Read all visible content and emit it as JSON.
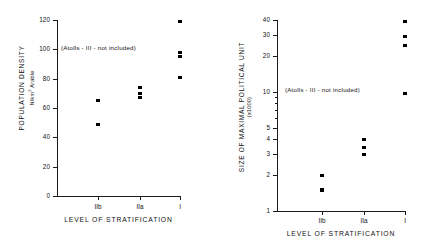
{
  "chart_data": [
    {
      "type": "scatter",
      "panel": "left",
      "title": "",
      "xlabel": "LEVEL OF STRATIFICATION",
      "ylabel": "POPULATION DENSITY",
      "ylabel_sub": "N/km",
      "ylabel_sub_exp": "2",
      "ylabel_sub_tail": " Arable",
      "annotation": "(Atolls - III - not included)",
      "yscale": "linear",
      "ylim": [
        0,
        120
      ],
      "yticks": [
        0,
        20,
        40,
        60,
        80,
        100,
        120
      ],
      "ytick_labels": [
        "0",
        "20",
        "40",
        "60",
        "80",
        "100",
        "120"
      ],
      "categories": [
        "IIb",
        "IIa",
        "I"
      ],
      "grid": false,
      "legend": "none",
      "series": [
        {
          "name": "IIb",
          "x": "IIb",
          "values": [
            65,
            49
          ]
        },
        {
          "name": "IIa",
          "x": "IIa",
          "values": [
            74,
            70,
            67
          ]
        },
        {
          "name": "I",
          "x": "I",
          "values": [
            119,
            98,
            95,
            81
          ]
        }
      ]
    },
    {
      "type": "scatter",
      "panel": "right",
      "title": "",
      "xlabel": "LEVEL OF STRATIFICATION",
      "ylabel": "SIZE OF MAXIMAL POLITICAL UNIT",
      "ylabel_sub": "(x1000)",
      "annotation": "(Atolls - III - not included)",
      "yscale": "log",
      "ylim": [
        1,
        40
      ],
      "yticks": [
        1,
        2,
        3,
        4,
        5,
        10,
        20,
        30,
        40
      ],
      "ytick_labels": [
        "1",
        "2",
        "3",
        "4",
        "5",
        "10",
        "20",
        "30",
        "40"
      ],
      "yminor": [
        6,
        7,
        8,
        9
      ],
      "categories": [
        "IIb",
        "IIa",
        "I"
      ],
      "grid": false,
      "legend": "none",
      "series": [
        {
          "name": "IIb",
          "x": "IIb",
          "values": [
            2.0,
            1.5
          ]
        },
        {
          "name": "IIa",
          "x": "IIa",
          "values": [
            4.0,
            3.4,
            3.0
          ]
        },
        {
          "name": "I",
          "x": "I",
          "values": [
            39,
            29,
            24.5,
            9.7
          ]
        }
      ]
    }
  ],
  "left": {
    "ylabel": "POPULATION DENSITY",
    "ylabel_sub_pre": "N/km",
    "ylabel_sub_exp": "2",
    "ylabel_sub_post": " Arable",
    "xlabel": "LEVEL OF STRATIFICATION",
    "annotation": "(Atolls - III - not included)",
    "ytick_labels": [
      "120",
      "100",
      "80",
      "60",
      "40",
      "20",
      "0"
    ],
    "xtick_labels": [
      "IIb",
      "IIa",
      "I"
    ]
  },
  "right": {
    "ylabel": "SIZE OF MAXIMAL POLITICAL UNIT",
    "ylabel_sub": "(x1000)",
    "xlabel": "LEVEL OF STRATIFICATION",
    "annotation": "(Atolls - III - not included)",
    "ytick_labels": [
      "40",
      "30",
      "20",
      "10",
      "5",
      "4",
      "3",
      "2",
      "1"
    ],
    "xtick_labels": [
      "IIb",
      "IIa",
      "I"
    ]
  }
}
